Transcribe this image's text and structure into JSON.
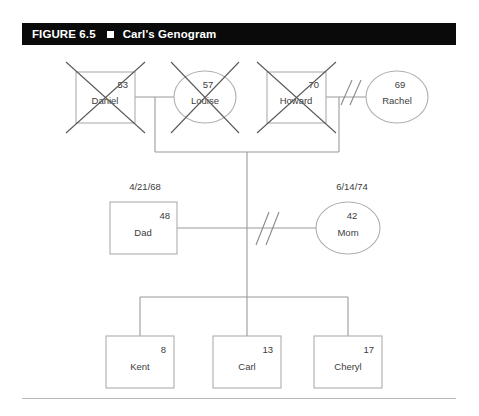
{
  "figure": {
    "label": "FIGURE 6.5",
    "separator_icon": "filled-square-icon",
    "title": "Carl's Genogram"
  },
  "genogram": {
    "generations": [
      {
        "name": "grandparents",
        "people": [
          {
            "id": "daniel",
            "name": "Daniel",
            "age": "53",
            "shape": "square",
            "gender": "male",
            "deceased": true,
            "birthdate": ""
          },
          {
            "id": "louise",
            "name": "Louise",
            "age": "57",
            "shape": "circle",
            "gender": "female",
            "deceased": true,
            "birthdate": ""
          },
          {
            "id": "howard",
            "name": "Howard",
            "age": "70",
            "shape": "square",
            "gender": "male",
            "deceased": true,
            "birthdate": ""
          },
          {
            "id": "rachel",
            "name": "Rachel",
            "age": "69",
            "shape": "circle",
            "gender": "female",
            "deceased": false,
            "birthdate": ""
          }
        ]
      },
      {
        "name": "parents",
        "people": [
          {
            "id": "dad",
            "name": "Dad",
            "age": "48",
            "shape": "square",
            "gender": "male",
            "deceased": false,
            "birthdate": "4/21/68"
          },
          {
            "id": "mom",
            "name": "Mom",
            "age": "42",
            "shape": "circle",
            "gender": "female",
            "deceased": false,
            "birthdate": "6/14/74"
          }
        ]
      },
      {
        "name": "children",
        "people": [
          {
            "id": "kent",
            "name": "Kent",
            "age": "8",
            "shape": "square",
            "gender": "male",
            "deceased": false,
            "birthdate": ""
          },
          {
            "id": "carl",
            "name": "Carl",
            "age": "13",
            "shape": "square",
            "gender": "male",
            "deceased": false,
            "birthdate": ""
          },
          {
            "id": "cheryl",
            "name": "Cheryl",
            "age": "17",
            "shape": "square",
            "gender": "male",
            "deceased": false,
            "birthdate": ""
          }
        ]
      }
    ],
    "relationships": [
      {
        "id": "daniel-louise",
        "partners": [
          "daniel",
          "louise"
        ],
        "status": "married"
      },
      {
        "id": "howard-rachel",
        "partners": [
          "howard",
          "rachel"
        ],
        "status": "divorced"
      },
      {
        "id": "dad-mom",
        "partners": [
          "dad",
          "mom"
        ],
        "status": "divorced"
      }
    ],
    "colors": {
      "titlebar_background": "#0a0a0a",
      "titlebar_text": "#ffffff",
      "shape_stroke": "#aeaeae",
      "link_stroke": "#9a9a9a",
      "deceased_mark": "#5a5a5a",
      "label_text": "#3c3c3c",
      "rule": "#b9b9b9"
    }
  }
}
